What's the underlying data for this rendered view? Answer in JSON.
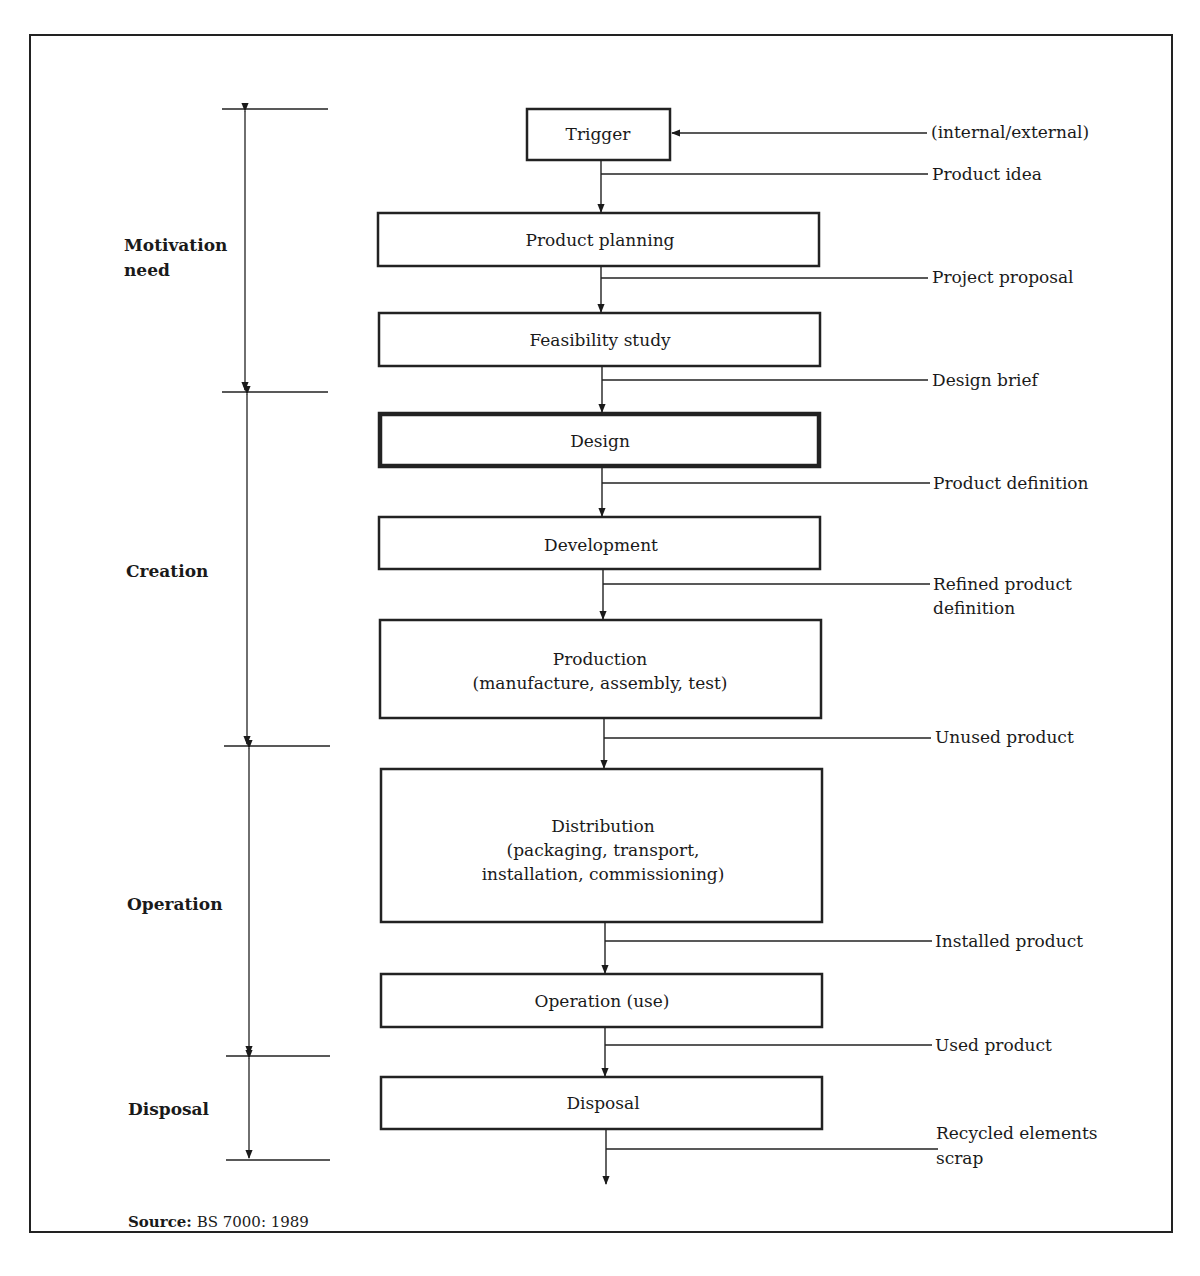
{
  "phases": [
    {
      "label_lines": [
        "Motivation",
        "need"
      ]
    },
    {
      "label_lines": [
        "Creation"
      ]
    },
    {
      "label_lines": [
        "Operation"
      ]
    },
    {
      "label_lines": [
        "Disposal"
      ]
    }
  ],
  "boxes": [
    {
      "lines": [
        "Trigger"
      ]
    },
    {
      "lines": [
        "Product planning"
      ]
    },
    {
      "lines": [
        "Feasibility study"
      ]
    },
    {
      "lines": [
        "Design"
      ]
    },
    {
      "lines": [
        "Development"
      ]
    },
    {
      "lines": [
        "Production",
        "(manufacture, assembly, test)"
      ]
    },
    {
      "lines": [
        "Distribution",
        "(packaging, transport,",
        "installation, commissioning)"
      ]
    },
    {
      "lines": [
        "Operation (use)"
      ]
    },
    {
      "lines": [
        "Disposal"
      ]
    }
  ],
  "trigger_input": "(internal/external)",
  "outputs": [
    {
      "lines": [
        "Product idea"
      ]
    },
    {
      "lines": [
        "Project proposal"
      ]
    },
    {
      "lines": [
        "Design brief"
      ]
    },
    {
      "lines": [
        "Product definition"
      ]
    },
    {
      "lines": [
        "Refined product",
        "definition"
      ]
    },
    {
      "lines": [
        "Unused product"
      ]
    },
    {
      "lines": [
        "Installed product"
      ]
    },
    {
      "lines": [
        "Used product"
      ]
    },
    {
      "lines": [
        "Recycled elements",
        "scrap"
      ]
    }
  ],
  "source": {
    "label": "Source:",
    "text": " BS 7000: 1989"
  }
}
